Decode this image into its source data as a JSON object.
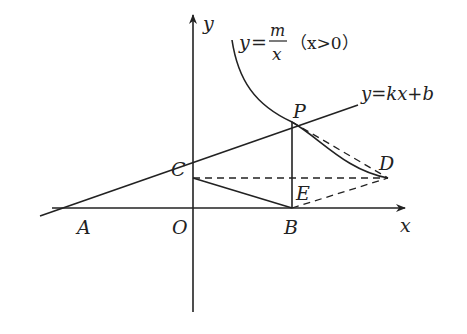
{
  "diagram": {
    "axes": {
      "x_label": "x",
      "y_label": "y",
      "origin_label": "O"
    },
    "points": {
      "A": "A",
      "B": "B",
      "C": "C",
      "D": "D",
      "E": "E",
      "P": "P"
    },
    "curve_label": {
      "lhs": "y",
      "eq": "=",
      "numerator": "m",
      "denominator": "x",
      "condition": "（x>0）"
    },
    "line_label": "y=kx+b",
    "colors": {
      "stroke": "#222222",
      "background": "#ffffff"
    }
  }
}
